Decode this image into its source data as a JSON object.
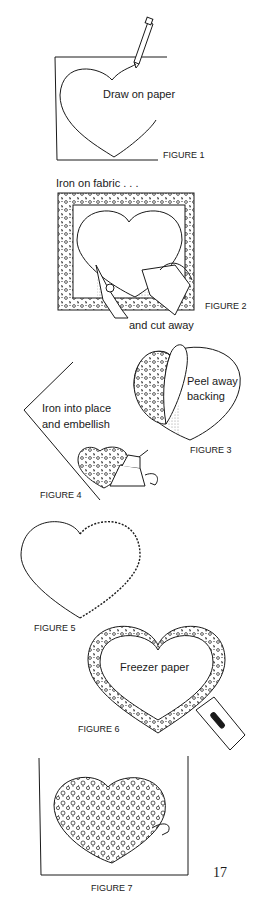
{
  "page": {
    "page_number": "17",
    "ink_color": "#1a1a1a",
    "background": "#ffffff"
  },
  "figures": [
    {
      "id": "figure-1",
      "caption": "FIGURE 1",
      "labels": [
        "Draw on paper"
      ]
    },
    {
      "id": "figure-2",
      "caption": "FIGURE 2",
      "labels": [
        "Iron on fabric . . .",
        "and cut away"
      ]
    },
    {
      "id": "figure-3",
      "caption": "FIGURE 3",
      "labels": [
        "Peel away",
        "backing"
      ]
    },
    {
      "id": "figure-4",
      "caption": "FIGURE 4",
      "labels": [
        "Iron into place",
        "and embellish"
      ]
    },
    {
      "id": "figure-5",
      "caption": "FIGURE 5",
      "labels": []
    },
    {
      "id": "figure-6",
      "caption": "FIGURE 6",
      "labels": [
        "Freezer paper"
      ]
    },
    {
      "id": "figure-7",
      "caption": "FIGURE 7",
      "labels": []
    }
  ]
}
